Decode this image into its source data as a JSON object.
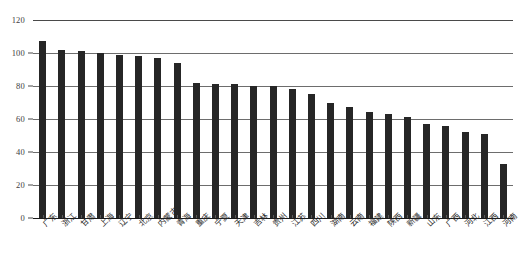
{
  "chart_data": {
    "type": "bar",
    "title": "",
    "subtitle": "",
    "xlabel": "",
    "ylabel": "",
    "ylim": [
      0,
      120
    ],
    "yticks": [
      0,
      20,
      40,
      60,
      80,
      100,
      120
    ],
    "grid": true,
    "legend": false,
    "legend_position": "none",
    "bar_color": "#262626",
    "categories": [
      "广东",
      "浙江",
      "甘肃",
      "上海",
      "辽宁",
      "北京",
      "内蒙古",
      "青海",
      "重庆",
      "宁夏",
      "天津",
      "吉林",
      "贵州",
      "江苏",
      "四川",
      "湖南",
      "云南",
      "福建",
      "陕西",
      "新疆",
      "山东",
      "广西",
      "河北",
      "江西",
      "河南"
    ],
    "values": [
      107,
      102,
      101,
      100,
      99,
      98,
      97,
      94,
      82,
      81,
      81,
      80,
      80,
      78,
      75,
      70,
      67,
      64,
      63,
      61,
      57,
      56,
      52,
      51,
      33
    ],
    "series": [
      {
        "name": "指数值",
        "values": [
          107,
          102,
          101,
          100,
          99,
          98,
          97,
          94,
          82,
          81,
          81,
          80,
          80,
          78,
          75,
          70,
          67,
          64,
          63,
          61,
          57,
          56,
          52,
          51,
          33
        ]
      }
    ]
  },
  "axis": {
    "y_tick_labels": [
      "0",
      "20",
      "40",
      "60",
      "80",
      "100",
      "120"
    ]
  }
}
